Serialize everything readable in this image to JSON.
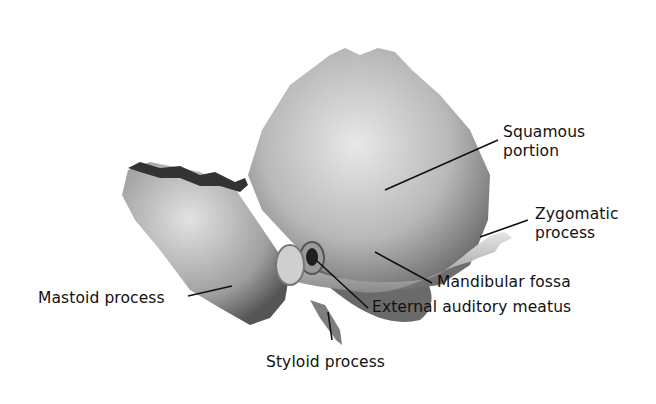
{
  "diagram": {
    "labels": {
      "squamous": [
        "Squamous",
        "portion"
      ],
      "zygomatic": [
        "Zygomatic",
        "process"
      ],
      "mandibular_fossa": "Mandibular fossa",
      "external_auditory_meatus": "External auditory meatus",
      "mastoid": "Mastoid process",
      "styloid": "Styloid process"
    },
    "colors": {
      "background": "#ffffff",
      "bone_light": "#dcdcdc",
      "bone_mid": "#a8a8a8",
      "bone_dark": "#5a5a5a",
      "leader_line": "#111111"
    }
  }
}
